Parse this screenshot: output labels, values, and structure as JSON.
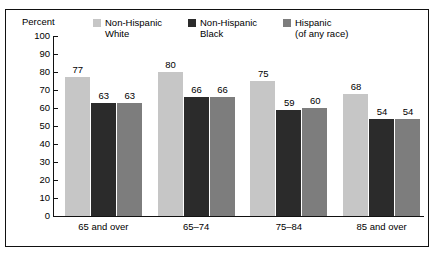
{
  "figure": {
    "clipped_header_text": "",
    "axis_title": "Percent"
  },
  "legend": {
    "items": [
      {
        "label": "Non-Hispanic\nWhite",
        "swatch_name": "legend-swatch-non-hispanic-white",
        "color": "#c6c6c6"
      },
      {
        "label": "Non-Hispanic\nBlack",
        "swatch_name": "legend-swatch-non-hispanic-black",
        "color": "#2b2b2b"
      },
      {
        "label": "Hispanic\n(of any race)",
        "swatch_name": "legend-swatch-hispanic",
        "color": "#7d7d7d"
      }
    ]
  },
  "chart_data": {
    "type": "bar",
    "title": "",
    "subtitle": "",
    "xlabel": "",
    "ylabel": "Percent",
    "ylim": [
      0,
      100
    ],
    "yticks": [
      0,
      10,
      20,
      30,
      40,
      50,
      60,
      70,
      80,
      90,
      100
    ],
    "ytick_labels": [
      "0",
      "10",
      "20",
      "30",
      "40",
      "50",
      "60",
      "70",
      "80",
      "90",
      "100"
    ],
    "grid": false,
    "legend_position": "top",
    "categories": [
      "65 and over",
      "65–74",
      "75–84",
      "85 and over"
    ],
    "series": [
      {
        "name": "Non-Hispanic White",
        "color": "#c6c6c6",
        "values": [
          77,
          80,
          75,
          68
        ]
      },
      {
        "name": "Non-Hispanic Black",
        "color": "#2b2b2b",
        "values": [
          63,
          66,
          59,
          54
        ]
      },
      {
        "name": "Hispanic (of any race)",
        "color": "#7d7d7d",
        "values": [
          63,
          66,
          60,
          54
        ]
      }
    ],
    "value_labels": [
      [
        "77",
        "63",
        "63"
      ],
      [
        "80",
        "66",
        "66"
      ],
      [
        "75",
        "59",
        "60"
      ],
      [
        "68",
        "54",
        "54"
      ]
    ]
  }
}
